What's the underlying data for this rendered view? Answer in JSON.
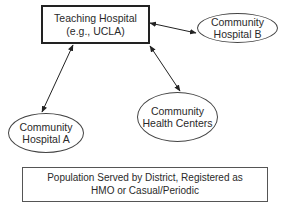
{
  "diagram": {
    "nodes": {
      "teaching_hospital": {
        "line1": "Teaching Hospital",
        "line2": "(e.g., UCLA)",
        "shape": "rectangle"
      },
      "community_hospital_b": {
        "line1": "Community",
        "line2": "Hospital B",
        "shape": "ellipse"
      },
      "community_hospital_a": {
        "line1": "Community",
        "line2": "Hospital A",
        "shape": "ellipse"
      },
      "community_health_centers": {
        "line1": "Community",
        "line2": "Health Centers",
        "shape": "ellipse"
      },
      "population": {
        "line1": "Population Served by District, Registered as",
        "line2": "HMO or Casual/Periodic",
        "shape": "rectangle"
      }
    },
    "edges": [
      {
        "from": "teaching_hospital",
        "to": "community_hospital_b",
        "type": "bidirectional-arrow"
      },
      {
        "from": "teaching_hospital",
        "to": "community_hospital_a",
        "type": "bidirectional-arrow"
      },
      {
        "from": "teaching_hospital",
        "to": "community_health_centers",
        "type": "bidirectional-arrow"
      }
    ],
    "colors": {
      "line": "#222222",
      "background": "#ffffff",
      "text": "#2a2a2a"
    }
  }
}
